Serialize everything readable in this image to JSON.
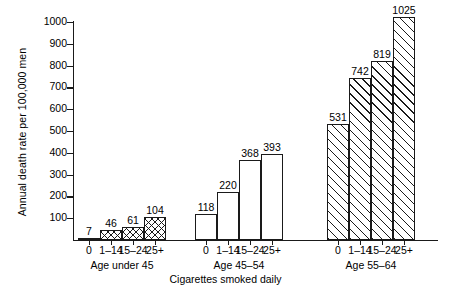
{
  "chart_data": {
    "type": "bar",
    "title": "",
    "xlabel": "Cigarettes smoked daily",
    "ylabel": "Annual death rate per 100,000 men",
    "ylim": [
      0,
      1000
    ],
    "yticks": [
      0,
      100,
      200,
      300,
      400,
      500,
      600,
      700,
      800,
      900,
      1000
    ],
    "ytick_labels": [
      "",
      "100",
      "200",
      "300",
      "400",
      "500",
      "600",
      "700",
      "800",
      "900",
      "1000"
    ],
    "grid": false,
    "legend": "none",
    "categories": [
      "0",
      "1–14",
      "15–24",
      "25+"
    ],
    "series": [
      {
        "name": "Age under 45",
        "fill": "crosshatch",
        "values": [
          7,
          46,
          61,
          104
        ]
      },
      {
        "name": "Age 45–54",
        "fill": "plain",
        "values": [
          118,
          220,
          368,
          393
        ]
      },
      {
        "name": "Age 55–64",
        "fill": "diagonal",
        "values": [
          531,
          742,
          819,
          1025
        ]
      }
    ],
    "value_labels_shown": true,
    "colors": {
      "ink": "#1a1a1a",
      "background": "#ffffff"
    }
  }
}
